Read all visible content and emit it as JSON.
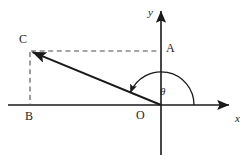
{
  "figure": {
    "background_color": "#ffffff",
    "stroke_color": "#1a1a1a",
    "dash_color": "#555555",
    "width": 251,
    "height": 162,
    "axes": {
      "x_axis_label": "x",
      "y_axis_label": "y",
      "origin_label": "O",
      "x_axis_y": 105,
      "x_axis_start_x": 8,
      "x_axis_end_x": 232,
      "y_axis_x": 161,
      "y_axis_top_y": 8,
      "y_axis_bottom_y": 155
    },
    "points": [
      {
        "name": "C",
        "label": "C",
        "x": 30,
        "y": 51,
        "label_x": 19,
        "label_y": 33
      },
      {
        "name": "A",
        "label": "A",
        "x": 161,
        "y": 51,
        "label_x": 166,
        "label_y": 42
      },
      {
        "name": "B",
        "label": "B",
        "x": 30,
        "y": 105,
        "label_x": 25,
        "label_y": 110
      },
      {
        "name": "O",
        "label": "O",
        "x": 161,
        "y": 105,
        "label_x": 136,
        "label_y": 109
      }
    ],
    "segments": [
      {
        "name": "ray-OC",
        "from": "O",
        "to": "C",
        "style": "solid",
        "arrow_at_end": true
      },
      {
        "name": "dashed-CA",
        "from": "C",
        "to": "A",
        "style": "dashed",
        "arrow_at_end": false
      },
      {
        "name": "dashed-CB",
        "from": "C",
        "to": "B",
        "style": "dashed",
        "arrow_at_end": false
      }
    ],
    "angle": {
      "name": "theta",
      "label": "θ",
      "label_x": 160,
      "label_y": 86,
      "radius": 33,
      "start_degrees": 0,
      "end_degrees": 158,
      "arrow_at_end": true,
      "vertex": "O"
    }
  }
}
